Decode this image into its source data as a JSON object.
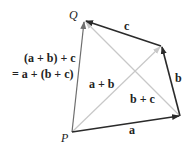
{
  "diagram": {
    "points": {
      "P": {
        "label": "P",
        "x": 72,
        "y": 132
      },
      "Q": {
        "label": "Q",
        "x": 84,
        "y": 20
      },
      "R": {
        "x": 180,
        "y": 116
      },
      "S": {
        "x": 161,
        "y": 46
      }
    },
    "vectors": [
      {
        "name": "a",
        "label": "a",
        "from": "P",
        "to": "R",
        "color": "#2a2a2a"
      },
      {
        "name": "b",
        "label": "b",
        "from": "R",
        "to": "S",
        "color": "#2a2a2a"
      },
      {
        "name": "c",
        "label": "c",
        "from": "S",
        "to": "Q",
        "color": "#2a2a2a"
      },
      {
        "name": "a+b",
        "label": "a + b",
        "from": "P",
        "to": "S",
        "color": "#c8c8c8"
      },
      {
        "name": "b+c",
        "label": "b + c",
        "from": "R",
        "to": "Q",
        "color": "#c8c8c8"
      },
      {
        "name": "sum",
        "label": "",
        "from": "P",
        "to": "Q",
        "color": "#6e6e6e"
      }
    ],
    "equation": {
      "line1": "(a + b) + c",
      "line2": "= a + (b + c)"
    }
  }
}
